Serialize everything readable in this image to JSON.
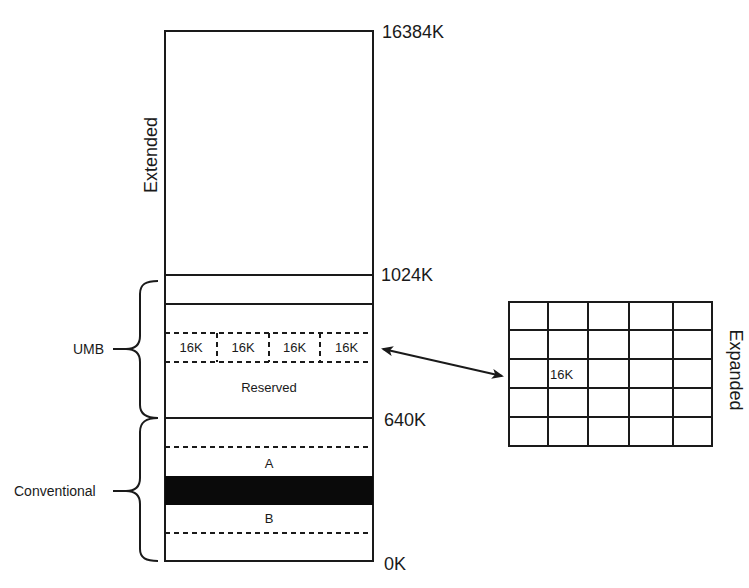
{
  "diagram": {
    "main_column": {
      "region_label": "Extended",
      "address_labels": {
        "top": "16384K",
        "upper": "1024K",
        "conventional_top": "640K",
        "bottom": "0K"
      },
      "page_frame_blocks": [
        "16K",
        "16K",
        "16K",
        "16K"
      ],
      "reserved_label": "Reserved",
      "block_a_label": "A",
      "block_b_label": "B"
    },
    "braces": {
      "umb_label": "UMB",
      "conventional_label": "Conventional"
    },
    "expanded": {
      "label": "Expanded",
      "grid_rows": 5,
      "grid_cols": 5,
      "page_label": "16K",
      "page_label_row": 3,
      "page_label_col": 2
    },
    "colors": {
      "line": "#1a1a1a",
      "fill_block": "#0a0a0a",
      "background": "#ffffff"
    }
  }
}
